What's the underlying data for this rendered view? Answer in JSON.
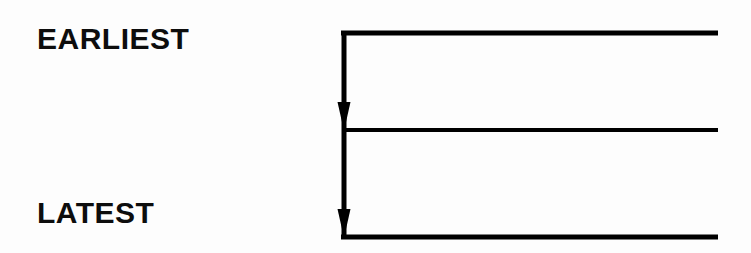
{
  "diagram": {
    "type": "timeline-branch-diagram",
    "background_color": "#fdfdfd",
    "stroke_color": "#000000",
    "labels": {
      "earliest": "EARLIEST",
      "latest": "LATEST"
    },
    "axis": {
      "name": "time-axis",
      "orientation": "vertical",
      "direction": "downward",
      "x": 344,
      "y_start": 31,
      "y_end": 239,
      "stroke_width": 5
    },
    "branches": [
      {
        "name": "branch-top",
        "y": 33,
        "x_start": 341,
        "x_end": 718,
        "stroke_width": 5
      },
      {
        "name": "branch-middle",
        "y": 130,
        "x_start": 344,
        "x_end": 718,
        "stroke_width": 4
      },
      {
        "name": "branch-bottom",
        "y": 237,
        "x_start": 341,
        "x_end": 718,
        "stroke_width": 5
      }
    ],
    "arrowheads": [
      {
        "name": "arrowhead-upper",
        "tip_x": 344,
        "tip_y": 131,
        "width": 13,
        "height": 29
      },
      {
        "name": "arrowhead-lower",
        "tip_x": 344,
        "tip_y": 238,
        "width": 13,
        "height": 29
      }
    ]
  }
}
